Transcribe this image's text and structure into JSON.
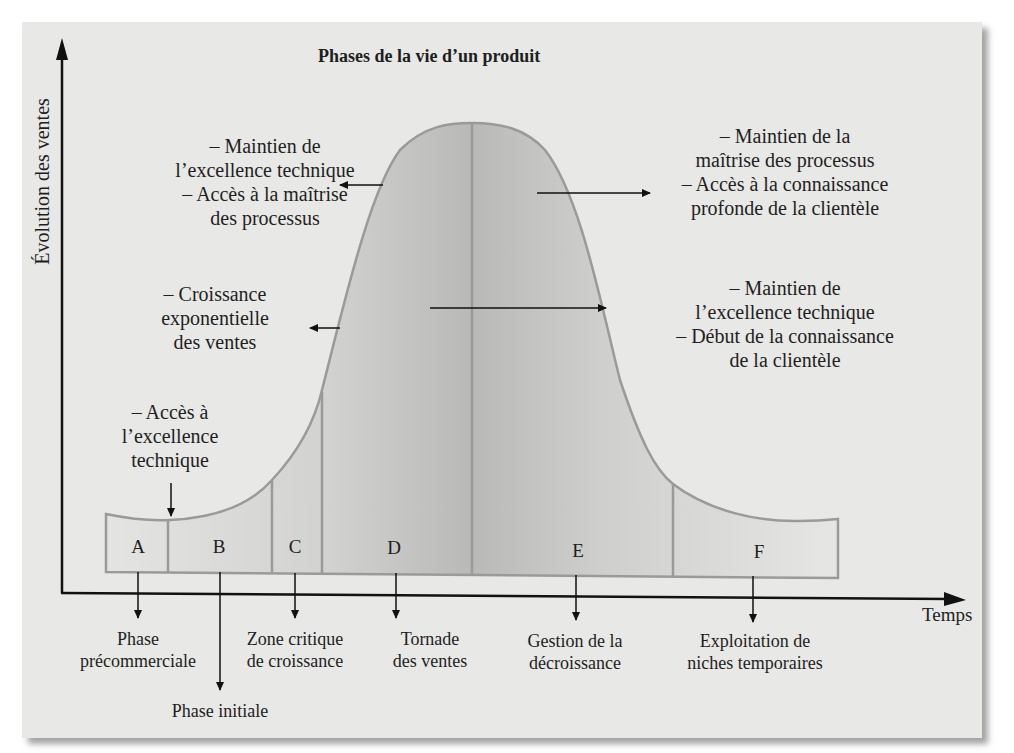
{
  "title": "Phases de la vie d’un produit",
  "axes": {
    "y_label": "Évolution des ventes",
    "x_label": "Temps"
  },
  "annotations": {
    "left_top": [
      "– Maintien de",
      "l’excellence technique",
      "– Accès à la maîtrise",
      "des processus"
    ],
    "left_middle": [
      "– Croissance",
      "exponentielle",
      "des ventes"
    ],
    "left_bottom": [
      "– Accès à",
      "l’excellence",
      "technique"
    ],
    "right_top": [
      "– Maintien de la",
      "maîtrise des processus",
      "– Accès à la connaissance",
      "profonde de la clientèle"
    ],
    "right_middle": [
      "– Maintien de",
      "l’excellence technique",
      "– Début de la connaissance",
      "de la clientèle"
    ]
  },
  "phases": [
    {
      "letter": "A",
      "label": [
        "Phase",
        "précommerciale"
      ]
    },
    {
      "letter": "B",
      "label": [
        "Phase initiale"
      ]
    },
    {
      "letter": "C",
      "label": [
        "Zone critique",
        "de croissance"
      ]
    },
    {
      "letter": "D",
      "label": [
        "Tornade",
        "des ventes"
      ]
    },
    {
      "letter": "E",
      "label": [
        "Gestion de la",
        "décroissance"
      ]
    },
    {
      "letter": "F",
      "label": [
        "Exploitation de",
        "niches temporaires"
      ]
    }
  ],
  "colors": {
    "card_background": "#e8e8e6",
    "curve_stroke": "#9a9a9a",
    "fill_light": "#e2e2e0",
    "fill_dark": "#bdbdbb",
    "axis": "#111111"
  }
}
